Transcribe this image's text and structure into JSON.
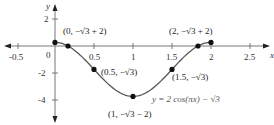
{
  "chart_data": {
    "type": "line",
    "title": "",
    "equation_label": "y = 2 cos(πx) − √3",
    "xlabel": "x",
    "ylabel": "y",
    "xlim": [
      -0.7,
      2.7
    ],
    "ylim": [
      -5,
      3
    ],
    "x_ticks": [
      "-0.5",
      "0",
      "0.5",
      "1",
      "1.5",
      "2",
      "2.5"
    ],
    "y_ticks": [
      "2",
      "-2",
      "-4"
    ],
    "grid": false,
    "series": [
      {
        "name": "y = 2cos(πx) − √3",
        "domain": [
          0,
          2
        ],
        "function": "2*cos(pi*x) - sqrt(3)"
      }
    ],
    "points": [
      {
        "x": 0,
        "y": 0.268,
        "label": "(0, −√3 + 2)"
      },
      {
        "x": 0.1667,
        "y": 0,
        "label": ""
      },
      {
        "x": 0.5,
        "y": -1.732,
        "label": "(0.5, −√3)"
      },
      {
        "x": 1,
        "y": -3.732,
        "label": "(1, −√3 − 2)"
      },
      {
        "x": 1.5,
        "y": -1.732,
        "label": "(1.5, −√3)"
      },
      {
        "x": 1.8333,
        "y": 0,
        "label": ""
      },
      {
        "x": 2,
        "y": 0.268,
        "label": "(2, −√3 + 2)"
      }
    ]
  }
}
